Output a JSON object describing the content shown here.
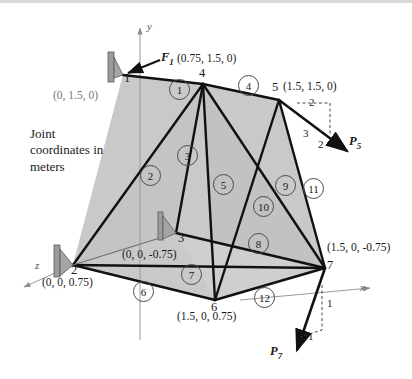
{
  "figure": {
    "note_line1": "Joint",
    "note_line2": "coordinates in",
    "note_line3": "meters",
    "note_full": "Joint coordinates in meters",
    "fill_color": "#c8c8c8",
    "line_color": "#111111",
    "axis_color": "#8a8a8a"
  },
  "axes": [
    {
      "name": "y-axis",
      "label": "y"
    },
    {
      "name": "x-axis",
      "label": "x"
    },
    {
      "name": "z-axis",
      "label": "z"
    }
  ],
  "joints": [
    {
      "id": "1",
      "number": "1",
      "coords": "(0, 1.5, 0)",
      "x": 123,
      "y": 75,
      "support": true
    },
    {
      "id": "2",
      "number": "2",
      "coords": "(0, 0, 0.75)",
      "x": 73,
      "y": 265,
      "support": true
    },
    {
      "id": "3",
      "number": "3",
      "coords": "(0, 0, -0.75)",
      "x": 176,
      "y": 233,
      "support": true
    },
    {
      "id": "4",
      "number": "4",
      "coords": "(0.75, 1.5, 0)",
      "x": 203,
      "y": 84,
      "support": false
    },
    {
      "id": "5",
      "number": "5",
      "coords": "(1.5, 1.5, 0)",
      "x": 279,
      "y": 100,
      "support": false
    },
    {
      "id": "6",
      "number": "6",
      "coords": "(1.5, 0, 0.75)",
      "x": 215,
      "y": 300,
      "support": false
    },
    {
      "id": "7",
      "number": "7",
      "coords": "(1.5, 0, -0.75)",
      "x": 325,
      "y": 268,
      "support": false
    }
  ],
  "members": [
    {
      "number": "1",
      "from": "1",
      "to": "4",
      "cx": 178,
      "cy": 89
    },
    {
      "number": "2",
      "from": "2",
      "to": "4",
      "cx": 149,
      "cy": 175
    },
    {
      "number": "3",
      "from": "3",
      "to": "4",
      "cx": 186,
      "cy": 155
    },
    {
      "number": "4",
      "from": "4",
      "to": "5",
      "cx": 247,
      "cy": 84
    },
    {
      "number": "5",
      "from": "4",
      "to": "6",
      "cx": 222,
      "cy": 184
    },
    {
      "number": "6",
      "from": "2",
      "to": "6",
      "cx": 142,
      "cy": 291
    },
    {
      "number": "7",
      "from": "2",
      "to": "7",
      "cx": 190,
      "cy": 274
    },
    {
      "number": "8",
      "from": "3",
      "to": "7",
      "cx": 257,
      "cy": 243
    },
    {
      "number": "9",
      "from": "5",
      "to": "6",
      "cx": 284,
      "cy": 185
    },
    {
      "number": "10",
      "from": "4",
      "to": "7",
      "cx": 262,
      "cy": 206
    },
    {
      "number": "11",
      "from": "5",
      "to": "7",
      "cx": 312,
      "cy": 188
    },
    {
      "number": "12",
      "from": "6",
      "to": "7",
      "cx": 263,
      "cy": 297
    }
  ],
  "forces": [
    {
      "name": "F1",
      "label": "F",
      "subscript": "1",
      "at_joint": "1",
      "slope_labels": []
    },
    {
      "name": "P5",
      "label": "P",
      "subscript": "5",
      "at_joint": "5",
      "slope_labels": [
        {
          "text": "2",
          "x": 309,
          "y": 106
        },
        {
          "text": "3",
          "x": 304,
          "y": 135
        },
        {
          "text": "2",
          "x": 318,
          "y": 146
        }
      ]
    },
    {
      "name": "P7",
      "label": "P",
      "subscript": "7",
      "at_joint": "7",
      "slope_labels": [
        {
          "text": "1",
          "x": 338,
          "y": 306
        },
        {
          "text": "1",
          "x": 324,
          "y": 338
        }
      ]
    }
  ]
}
